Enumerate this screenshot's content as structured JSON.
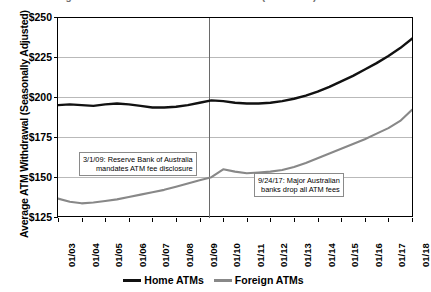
{
  "title": {
    "text_partial": "Average ATM Withdrawal Amounts in Australia (2003-2018)"
  },
  "axes": {
    "y_title": "Average ATM Withdrawal (Seasonally Adjusted)",
    "y_ticks": [
      "$250",
      "$225",
      "$200",
      "$175",
      "$150",
      "$125"
    ],
    "x_ticks": [
      "01/03",
      "01/04",
      "01/05",
      "01/06",
      "01/07",
      "01/08",
      "01/09",
      "01/10",
      "01/11",
      "01/12",
      "01/13",
      "01/14",
      "01/15",
      "01/16",
      "01/17",
      "01/18"
    ]
  },
  "legend": {
    "items": [
      {
        "label": "Home ATMs",
        "color": "#111111"
      },
      {
        "label": "Foreign ATMs",
        "color": "#888888"
      }
    ]
  },
  "annotations": [
    {
      "id": "rba-disclosure",
      "line1": "3/1/09:  Reserve Bank of Australia",
      "line2": "mandates ATM fee disclosure"
    },
    {
      "id": "banks-drop-fees",
      "line1": "9/24/17:  Major Australian",
      "line2": "banks drop all ATM fees"
    }
  ],
  "colors": {
    "home": "#111111",
    "foreign": "#888888",
    "grid": "#b9b9b9",
    "vline": "#6a6a6a",
    "frame": "#000000"
  },
  "chart_data": {
    "type": "line",
    "title": "Average ATM Withdrawal Amounts in Australia (2003-2018)",
    "xlabel": "",
    "ylabel": "Average ATM Withdrawal (Seasonally Adjusted)",
    "ylim": [
      125,
      250
    ],
    "ytick_step": 25,
    "grid": true,
    "legend_position": "bottom",
    "x": [
      "01/03",
      "07/03",
      "01/04",
      "07/04",
      "01/05",
      "07/05",
      "01/06",
      "07/06",
      "01/07",
      "07/07",
      "01/08",
      "07/08",
      "01/09",
      "07/09",
      "01/10",
      "07/10",
      "01/11",
      "07/11",
      "01/12",
      "07/12",
      "01/13",
      "07/13",
      "01/14",
      "07/14",
      "01/15",
      "07/15",
      "01/16",
      "07/16",
      "01/17",
      "07/17",
      "01/18"
    ],
    "series": [
      {
        "name": "Home ATMs",
        "color": "#111111",
        "values": [
          195.0,
          195.5,
          195.0,
          194.5,
          195.5,
          196.0,
          195.5,
          194.5,
          193.5,
          193.5,
          194.0,
          195.0,
          196.5,
          198.0,
          197.5,
          196.5,
          196.0,
          196.0,
          196.5,
          197.5,
          199.0,
          201.0,
          203.5,
          206.5,
          210.0,
          213.5,
          217.5,
          221.5,
          226.0,
          231.0,
          237.0
        ]
      },
      {
        "name": "Foreign ATMs",
        "color": "#888888",
        "values": [
          136.0,
          134.0,
          133.0,
          133.5,
          134.5,
          135.5,
          137.0,
          138.5,
          140.0,
          141.5,
          143.5,
          145.5,
          147.5,
          149.5,
          154.5,
          153.0,
          152.0,
          152.5,
          153.0,
          154.0,
          156.0,
          158.5,
          161.5,
          164.5,
          167.5,
          170.5,
          173.5,
          177.0,
          180.5,
          185.0,
          192.0
        ]
      }
    ],
    "reference_lines": [
      {
        "x": "03/09",
        "label": "3/1/09: Reserve Bank of Australia mandates ATM fee disclosure",
        "orientation": "vertical"
      }
    ],
    "annotations": [
      {
        "x": "03/09",
        "text": "3/1/09:  Reserve Bank of Australia mandates ATM fee disclosure"
      },
      {
        "x": "09/17",
        "text": "9/24/17:  Major Australian banks drop all ATM fees"
      }
    ]
  }
}
